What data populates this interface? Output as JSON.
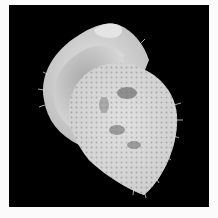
{
  "image": {
    "subject": "spiny seashell",
    "background_color": "#000000",
    "border_color": "#fbfbfb"
  }
}
